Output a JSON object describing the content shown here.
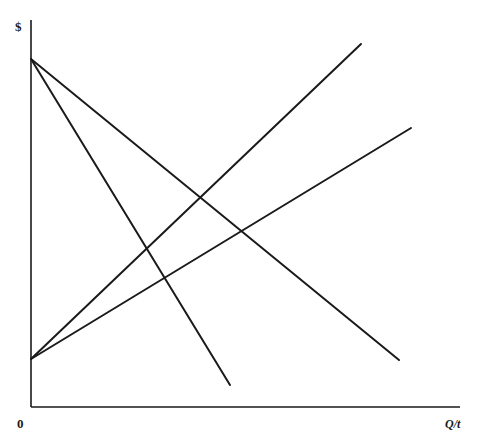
{
  "diagram": {
    "type": "economics-line-diagram",
    "axes": {
      "y_label": "$",
      "x_label": "Q/t",
      "origin_label": "0",
      "origin": [
        31,
        407
      ],
      "y_top": [
        31,
        20
      ],
      "x_end": [
        460,
        407
      ]
    },
    "lines": [
      {
        "id": "falling-steep",
        "from": [
          31,
          59
        ],
        "to": [
          230,
          385
        ]
      },
      {
        "id": "falling-shallow",
        "from": [
          31,
          59
        ],
        "to": [
          399,
          360
        ]
      },
      {
        "id": "rising-steep",
        "from": [
          31,
          359
        ],
        "to": [
          361,
          44
        ]
      },
      {
        "id": "rising-shallow",
        "from": [
          31,
          359
        ],
        "to": [
          411,
          128
        ]
      }
    ],
    "colors": {
      "line": "#1a1a1a",
      "background": "#ffffff"
    }
  }
}
